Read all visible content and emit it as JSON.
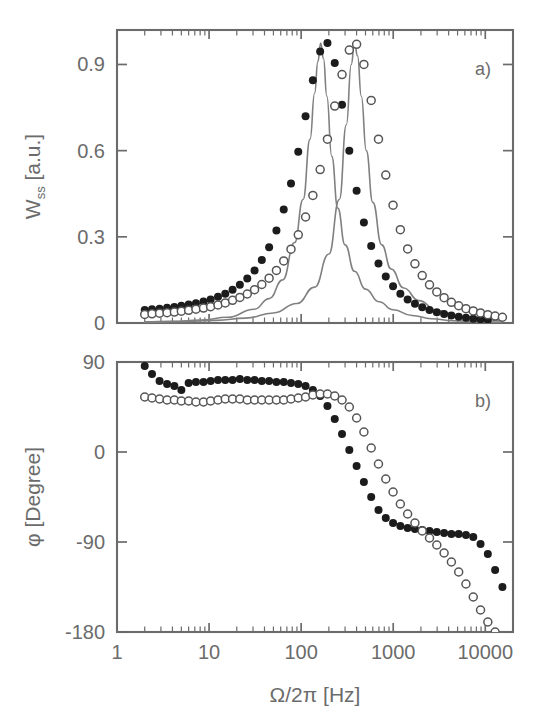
{
  "figure": {
    "title": "",
    "panels": [
      "a)",
      "b)"
    ]
  },
  "panel_a": {
    "label": "a)",
    "ylabel": "W",
    "ylabel_sub": "ss",
    "ylabel_unit": "[a.u.]",
    "ytick_labels": [
      "0.9",
      "0.6",
      "0.3",
      "0"
    ]
  },
  "panel_b": {
    "label": "b)",
    "ylabel": "φ",
    "ylabel_unit": "[Degree]",
    "ytick_labels": [
      "90",
      "0",
      "-90",
      "-180"
    ]
  },
  "xaxis": {
    "label_symbol": "Ω/2π",
    "label_unit": "[Hz]",
    "tick_labels": [
      "1",
      "10",
      "100",
      "1000",
      "10000"
    ]
  },
  "colors": {
    "axis": "#6b6b6b",
    "text": "#6b6b6b",
    "filled_marker": "#1c1c1c",
    "open_marker": "#555555",
    "fit_line": "#808080",
    "background": "#ffffff"
  },
  "chart_data": {
    "type": "line",
    "title": "",
    "xlabel": "Ω/2π  [Hz]",
    "xscale": "log",
    "xlim": [
      1,
      20000
    ],
    "xticks": [
      1,
      10,
      100,
      1000,
      10000
    ],
    "grid": false,
    "legend": "none",
    "subplots": [
      {
        "panel": "a)",
        "ylabel": "W_ss [a.u.]",
        "ylim": [
          0,
          1.02
        ],
        "yticks": [
          0,
          0.3,
          0.6,
          0.9
        ],
        "series": [
          {
            "name": "filled-circles",
            "marker": "filled-circle",
            "x": [
              2.0,
              2.4,
              2.9,
              3.5,
              4.2,
              5.0,
              6.0,
              7.2,
              8.7,
              10.4,
              12.5,
              15.0,
              18.0,
              21.6,
              26.0,
              31.2,
              37.4,
              44.9,
              53.9,
              64.7,
              77.6,
              93.1,
              111.7,
              134.1,
              160.9,
              193.1,
              231.7,
              278.0,
              333.6,
              400.4,
              480.4,
              576.5,
              691.8,
              830.2,
              996.2,
              1195.5,
              1434.6,
              1721.5,
              2065.8,
              2479.0,
              2974.8,
              3569.8,
              4283.7,
              5140.5,
              6168.6,
              7402.3,
              8882.8,
              10659.3
            ],
            "y": [
              0.045,
              0.048,
              0.05,
              0.053,
              0.056,
              0.06,
              0.064,
              0.069,
              0.075,
              0.082,
              0.091,
              0.102,
              0.116,
              0.133,
              0.155,
              0.183,
              0.219,
              0.264,
              0.322,
              0.395,
              0.486,
              0.596,
              0.72,
              0.845,
              0.945,
              0.975,
              0.905,
              0.76,
              0.6,
              0.46,
              0.35,
              0.268,
              0.207,
              0.162,
              0.128,
              0.102,
              0.082,
              0.067,
              0.055,
              0.045,
              0.037,
              0.031,
              0.026,
              0.022,
              0.018,
              0.015,
              0.013,
              0.011
            ]
          },
          {
            "name": "open-circles",
            "marker": "open-circle",
            "x": [
              2.0,
              2.4,
              2.9,
              3.5,
              4.2,
              5.0,
              6.0,
              7.2,
              8.7,
              10.4,
              12.5,
              15.0,
              18.0,
              21.6,
              26.0,
              31.2,
              37.4,
              44.9,
              53.9,
              64.7,
              77.6,
              93.1,
              111.7,
              134.1,
              160.9,
              193.1,
              231.7,
              278.0,
              333.6,
              400.4,
              480.4,
              576.5,
              691.8,
              830.2,
              996.2,
              1195.5,
              1434.6,
              1721.5,
              2065.8,
              2479.0,
              2974.8,
              3569.8,
              4283.7,
              5140.5,
              6168.6,
              7402.3,
              8882.8,
              10659.3,
              12791.0,
              15349.0
            ],
            "y": [
              0.03,
              0.032,
              0.034,
              0.036,
              0.038,
              0.041,
              0.044,
              0.048,
              0.052,
              0.057,
              0.063,
              0.07,
              0.079,
              0.089,
              0.101,
              0.116,
              0.134,
              0.156,
              0.183,
              0.216,
              0.257,
              0.307,
              0.369,
              0.444,
              0.534,
              0.64,
              0.755,
              0.865,
              0.95,
              0.97,
              0.9,
              0.775,
              0.64,
              0.515,
              0.41,
              0.325,
              0.258,
              0.206,
              0.165,
              0.133,
              0.108,
              0.088,
              0.072,
              0.06,
              0.05,
              0.042,
              0.035,
              0.029,
              0.024,
              0.02
            ]
          },
          {
            "name": "fit-line-left",
            "marker": "line",
            "x": [
              2.0,
              4.0,
              8.0,
              16.0,
              31.0,
              45.0,
              63.0,
              85.0,
              105.0,
              125.0,
              140.0,
              152.0,
              163.0,
              175.0,
              190.0,
              215.0,
              250.0,
              300.0,
              380.0,
              500.0,
              700.0,
              1000.0,
              1600.0,
              2600.0,
              4500.0,
              8000.0,
              15000.0
            ],
            "y": [
              0.004,
              0.006,
              0.01,
              0.02,
              0.048,
              0.085,
              0.15,
              0.28,
              0.43,
              0.64,
              0.8,
              0.91,
              0.975,
              0.92,
              0.79,
              0.58,
              0.4,
              0.272,
              0.18,
              0.118,
              0.074,
              0.046,
              0.026,
              0.015,
              0.008,
              0.005,
              0.003
            ]
          },
          {
            "name": "fit-line-right",
            "marker": "line",
            "x": [
              2.0,
              5.0,
              12.0,
              25.0,
              50.0,
              90.0,
              140.0,
              200.0,
              260.0,
              310.0,
              350.0,
              380.0,
              410.0,
              450.0,
              510.0,
              600.0,
              750.0,
              950.0,
              1300.0,
              1900.0,
              3000.0,
              5200.0,
              9000.0,
              15000.0
            ],
            "y": [
              0.003,
              0.005,
              0.009,
              0.017,
              0.035,
              0.068,
              0.125,
              0.24,
              0.43,
              0.69,
              0.9,
              0.975,
              0.93,
              0.79,
              0.6,
              0.42,
              0.272,
              0.188,
              0.122,
              0.078,
              0.044,
              0.024,
              0.013,
              0.008
            ]
          }
        ]
      },
      {
        "panel": "b)",
        "ylabel": "φ [Degree]",
        "ylim": [
          -180,
          90
        ],
        "yticks": [
          -180,
          -90,
          0,
          90
        ],
        "series": [
          {
            "name": "filled-circles",
            "marker": "filled-circle",
            "x": [
              2.0,
              2.4,
              2.9,
              3.5,
              4.2,
              5.0,
              6.0,
              7.2,
              8.7,
              10.4,
              12.5,
              15.0,
              18.0,
              21.6,
              26.0,
              31.2,
              37.4,
              44.9,
              53.9,
              64.7,
              77.6,
              93.1,
              111.7,
              134.1,
              160.9,
              193.1,
              231.7,
              278.0,
              333.6,
              400.4,
              480.4,
              576.5,
              691.8,
              830.2,
              996.2,
              1195.5,
              1434.6,
              1721.5,
              2065.8,
              2479.0,
              2974.8,
              3569.8,
              4283.7,
              5140.5,
              6168.6,
              7402.3,
              8882.8,
              10659.3,
              12791.0,
              15349.0
            ],
            "y": [
              86,
              78,
              71,
              68,
              66,
              62,
              69,
              70,
              70,
              71,
              72,
              72,
              72,
              73,
              72,
              72,
              71,
              71,
              70,
              70,
              69,
              68,
              66,
              62,
              56,
              46,
              33,
              18,
              2,
              -14,
              -30,
              -45,
              -58,
              -66,
              -71,
              -74,
              -76,
              -77,
              -78,
              -79,
              -80,
              -81,
              -82,
              -82,
              -83,
              -85,
              -92,
              -102,
              -118,
              -135
            ]
          },
          {
            "name": "open-circles",
            "marker": "open-circle",
            "x": [
              2.0,
              2.4,
              2.9,
              3.5,
              4.2,
              5.0,
              6.0,
              7.2,
              8.7,
              10.4,
              12.5,
              15.0,
              18.0,
              21.6,
              26.0,
              31.2,
              37.4,
              44.9,
              53.9,
              64.7,
              77.6,
              93.1,
              111.7,
              134.1,
              160.9,
              193.1,
              231.7,
              278.0,
              333.6,
              400.4,
              480.4,
              576.5,
              691.8,
              830.2,
              996.2,
              1195.5,
              1434.6,
              1721.5,
              2065.8,
              2479.0,
              2974.8,
              3569.8,
              4283.7,
              5140.5,
              6168.6,
              7402.3,
              8882.8,
              10659.3,
              12791.0,
              15349.0
            ],
            "y": [
              55,
              54,
              53,
              52,
              52,
              51,
              51,
              50,
              50,
              51,
              52,
              53,
              53,
              53,
              52,
              52,
              52,
              52,
              52,
              52,
              53,
              54,
              55,
              57,
              58,
              58,
              56,
              52,
              45,
              34,
              20,
              4,
              -12,
              -27,
              -40,
              -52,
              -62,
              -71,
              -79,
              -86,
              -93,
              -101,
              -110,
              -120,
              -132,
              -145,
              -158,
              -170,
              -180,
              -190
            ]
          }
        ]
      }
    ]
  }
}
